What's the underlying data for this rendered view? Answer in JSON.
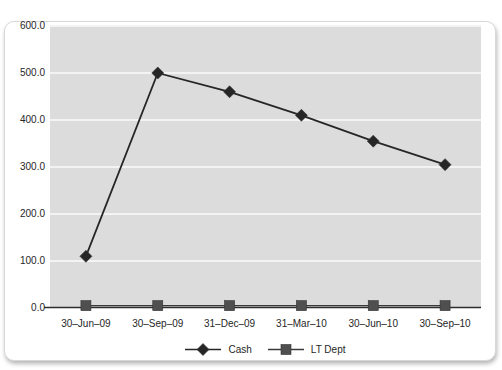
{
  "chart_data": {
    "type": "line",
    "title": "",
    "xlabel": "",
    "ylabel": "",
    "categories": [
      "30–Jun–09",
      "30–Sep–09",
      "31–Dec–09",
      "31–Mar–10",
      "30–Jun–10",
      "30–Sep–10"
    ],
    "series": [
      {
        "name": "LT Dept",
        "marker": "square",
        "color": "#3a3a3a",
        "marker_color": "#4f4f4f",
        "values": [
          5,
          5,
          5,
          5,
          5,
          5
        ]
      },
      {
        "name": "Cash",
        "marker": "diamond",
        "color": "#262626",
        "marker_color": "#262626",
        "values": [
          110,
          500,
          460,
          410,
          355,
          305
        ]
      }
    ],
    "ylim": [
      0,
      600
    ],
    "ytick_interval": 100,
    "ytick_labels": [
      "0.0",
      "100.0",
      "200.0",
      "300.0",
      "400.0",
      "500.0",
      "600.0"
    ],
    "grid": "horizontal",
    "legend_position": "bottom-center",
    "legend_order": [
      "Cash",
      "LT Dept"
    ]
  },
  "style": {
    "plot_bg": "#dcdcdc",
    "gridline_color": "#f3f3f3",
    "axis_line_color": "#2e2e2e",
    "text_color": "#262626",
    "card_bg": "#ffffff",
    "card_border": "#d8d8d8"
  }
}
